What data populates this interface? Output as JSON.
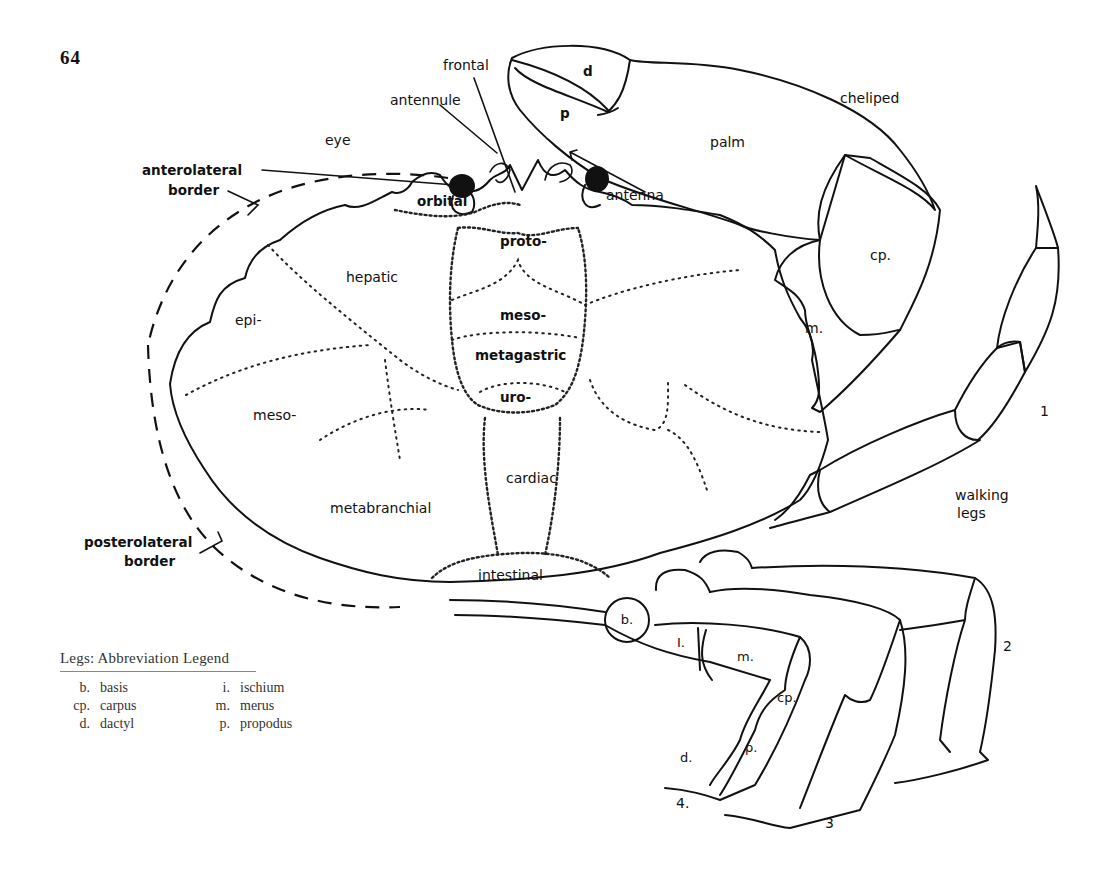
{
  "page": {
    "number": "64"
  },
  "carapace": {
    "borders": {
      "anterolateral": [
        "anterolateral",
        "border"
      ],
      "posterolateral": [
        "posterolateral",
        "border"
      ]
    },
    "features": {
      "eye": "eye",
      "antennule": "antennule",
      "frontal": "frontal",
      "antenna": "antenna"
    },
    "regions": {
      "orbital": "orbital",
      "proto": "proto-",
      "hepatic": "hepatic",
      "epi": "epi-",
      "meso_gastric": "meso-",
      "metagastric": "metagastric",
      "uro": "uro-",
      "meso_branchial": "meso-",
      "cardiac": "cardiac",
      "metabranchial": "metabranchial",
      "intestinal": "intestinal"
    }
  },
  "cheliped": {
    "label": "cheliped",
    "segments": {
      "dactyl": "d",
      "propodus": "p",
      "palm": "palm",
      "carpus": "cp.",
      "merus": "m."
    }
  },
  "walking_legs": {
    "label": [
      "walking",
      "legs"
    ],
    "numbers": [
      "1",
      "2",
      "3",
      "4."
    ],
    "segments": {
      "basis": "b.",
      "ischium": "I.",
      "merus": "m.",
      "carpus": "cp.",
      "propodus": "p.",
      "dactyl": "d."
    }
  },
  "legend": {
    "title": "Legs: Abbreviation Legend",
    "rows": [
      [
        {
          "abbr": "b.",
          "term": "basis"
        },
        {
          "abbr": "i.",
          "term": "ischium"
        }
      ],
      [
        {
          "abbr": "cp.",
          "term": "carpus"
        },
        {
          "abbr": "m.",
          "term": "merus"
        }
      ],
      [
        {
          "abbr": "d.",
          "term": "dactyl"
        },
        {
          "abbr": "p.",
          "term": "propodus"
        }
      ]
    ]
  }
}
